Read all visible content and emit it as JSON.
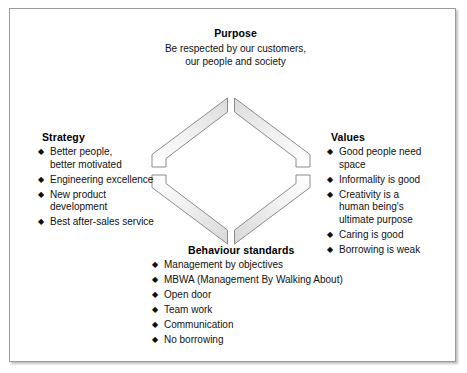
{
  "figure": {
    "accent_color": "#e9e9e9",
    "outline_color": "#8c8c8c",
    "frame_color": "#9b9b9b",
    "text_color": "#111111",
    "bullet_glyph": "◆"
  },
  "purpose": {
    "heading": "Purpose",
    "line1": "Be respected by our customers,",
    "line2": "our people and society"
  },
  "strategy": {
    "heading": "Strategy",
    "items": [
      "Better people,\nbetter motivated",
      "Engineering excellence",
      "New product\ndevelopment",
      "Best after-sales service"
    ]
  },
  "values": {
    "heading": "Values",
    "items": [
      "Good people need\nspace",
      "Informality is good",
      "Creativity is a\nhuman being's\nultimate purpose",
      "Caring is good",
      "Borrowing is weak"
    ]
  },
  "behaviour": {
    "heading": "Behaviour standards",
    "items": [
      "Management by objectives",
      "MBWA (Management By Walking About)",
      "Open door",
      "Team work",
      "Communication",
      "No borrowing"
    ]
  },
  "diamond": {
    "segment_names": [
      "top-left-segment",
      "top-right-segment",
      "bottom-right-segment",
      "bottom-left-segment"
    ]
  }
}
